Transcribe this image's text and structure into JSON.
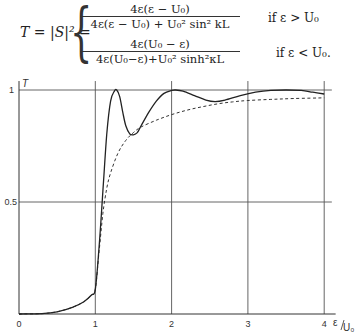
{
  "formula": {
    "lhs": "T = |S|² =",
    "case1": {
      "numerator": "4ε(ε − U₀)",
      "denominator": "4ε(ε − U₀) + U₀² sin² kL",
      "suffix": ",",
      "condition": "if   ε > U₀"
    },
    "case2": {
      "numerator": "4ε(U₀ − ε)",
      "denominator": "4ε(U₀−ε)+U₀² sinh²κL",
      "suffix": ",",
      "condition": "if  ε < U₀."
    }
  },
  "chart_data": {
    "type": "line",
    "title": "",
    "xlabel": "ε/U₀",
    "ylabel": "T",
    "xlim": [
      0,
      4.1
    ],
    "ylim": [
      0,
      1.0
    ],
    "x_ticks": [
      "0",
      "1",
      "2",
      "3",
      "4"
    ],
    "y_ticks": [
      "0.5",
      "1"
    ],
    "grid": true,
    "grid_x": [
      1,
      2,
      3,
      4
    ],
    "grid_y": [
      0.5,
      1
    ],
    "legend": "none",
    "series": [
      {
        "name": "T (square barrier, solid)",
        "style": "solid",
        "x": [
          0.0,
          0.3,
          0.5,
          0.7,
          0.85,
          0.95,
          1.0,
          1.05,
          1.1,
          1.15,
          1.2,
          1.25,
          1.28,
          1.32,
          1.36,
          1.4,
          1.45,
          1.5,
          1.55,
          1.6,
          1.7,
          1.8,
          1.9,
          2.0,
          2.05,
          2.15,
          2.3,
          2.45,
          2.57,
          2.7,
          2.9,
          3.1,
          3.3,
          3.5,
          3.7,
          3.85,
          4.0
        ],
        "values": [
          0.0,
          0.002,
          0.01,
          0.03,
          0.055,
          0.085,
          0.11,
          0.3,
          0.55,
          0.8,
          0.95,
          0.995,
          1.0,
          0.97,
          0.9,
          0.84,
          0.805,
          0.8,
          0.81,
          0.84,
          0.9,
          0.95,
          0.985,
          0.998,
          1.0,
          0.995,
          0.975,
          0.955,
          0.948,
          0.955,
          0.975,
          0.99,
          0.998,
          1.0,
          0.998,
          0.99,
          0.982
        ]
      },
      {
        "name": "T (dashed envelope)",
        "style": "dashed",
        "x": [
          0.0,
          0.3,
          0.5,
          0.7,
          0.85,
          0.95,
          1.0,
          1.05,
          1.1,
          1.15,
          1.2,
          1.3,
          1.4,
          1.5,
          1.6,
          1.8,
          2.0,
          2.2,
          2.4,
          2.6,
          2.8,
          3.0,
          3.3,
          3.6,
          4.0
        ],
        "values": [
          0.0,
          0.002,
          0.01,
          0.03,
          0.055,
          0.085,
          0.11,
          0.28,
          0.45,
          0.56,
          0.63,
          0.72,
          0.775,
          0.81,
          0.835,
          0.865,
          0.89,
          0.91,
          0.925,
          0.938,
          0.947,
          0.953,
          0.958,
          0.962,
          0.965
        ]
      }
    ]
  },
  "axes": {
    "y_label": "T",
    "x_label_num": "ε",
    "x_label_den": "U₀",
    "x_ticks": [
      "0",
      "1",
      "2",
      "3",
      "4"
    ],
    "y_ticks": [
      "1",
      "0.5"
    ]
  }
}
